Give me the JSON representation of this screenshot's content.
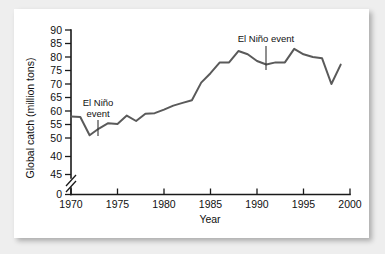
{
  "chart_data": {
    "type": "line",
    "title": "",
    "xlabel": "Year",
    "ylabel": "Global catch (million tons)",
    "xlim": [
      1970,
      2000
    ],
    "ylim": [
      42,
      90
    ],
    "grid": false,
    "legend": "none",
    "axis_break": {
      "axis": "y",
      "between": [
        0,
        45
      ],
      "symbol": "//"
    },
    "xticks": [
      1970,
      1975,
      1980,
      1985,
      1990,
      1995,
      2000
    ],
    "xtick_labels": [
      "1970",
      "1975",
      "1980",
      "1985",
      "1990",
      "1995",
      "2000"
    ],
    "yticks": [
      90,
      85,
      80,
      75,
      70,
      65,
      60,
      55,
      50,
      45,
      0
    ],
    "ytick_labels": [
      "90",
      "85",
      "80",
      "75",
      "70",
      "65",
      "60",
      "55",
      "50",
      "40",
      "45",
      "0"
    ],
    "line_color": "#5a5a5a",
    "series": [
      {
        "name": "Global catch",
        "x": [
          1970,
          1971,
          1972,
          1973,
          1974,
          1975,
          1976,
          1977,
          1978,
          1979,
          1980,
          1981,
          1982,
          1983,
          1984,
          1985,
          1986,
          1987,
          1988,
          1989,
          1990,
          1991,
          1992,
          1993,
          1994,
          1995,
          1996,
          1997,
          1998,
          1999
        ],
        "values": [
          58.0,
          57.8,
          51.0,
          53.5,
          55.5,
          55.2,
          58.3,
          56.3,
          59.0,
          59.2,
          60.5,
          62.0,
          63.0,
          64.0,
          70.5,
          74.0,
          78.0,
          78.0,
          82.2,
          81.0,
          78.5,
          77.2,
          78.0,
          78.0,
          83.0,
          81.0,
          80.0,
          79.5,
          70.0,
          77.2
        ]
      }
    ],
    "annotations": [
      {
        "id": "el-nino-1972",
        "text_lines": [
          "El Niño",
          "event"
        ],
        "points_to_year": 1972.6,
        "points_to_value": 52.5
      },
      {
        "id": "el-nino-1991",
        "text_lines": [
          "El Niño event"
        ],
        "points_to_year": 1991.0,
        "points_to_value": 77.3
      }
    ]
  }
}
